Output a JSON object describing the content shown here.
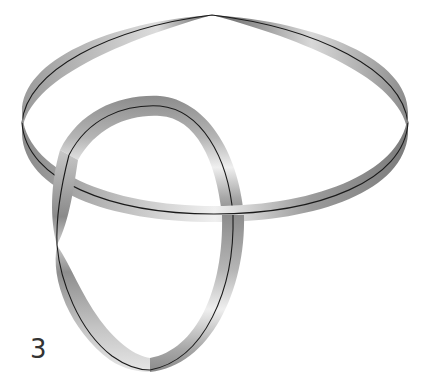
{
  "figure": {
    "label": "3",
    "colors": {
      "background": "#ffffff",
      "band_dark": "#7a7a7a",
      "band_light": "#f2f2f2",
      "centerline": "#1a1a1a",
      "label": "#333333"
    },
    "rings": [
      {
        "name": "horizontal-ring",
        "center": [
          214,
          112
        ],
        "rx": 192,
        "ry": 92,
        "band_width": 22,
        "twist_at": [
          212,
          15
        ]
      },
      {
        "name": "vertical-ring",
        "center": [
          146,
          232
        ],
        "rx": 96,
        "ry": 138,
        "band_width": 22,
        "twist_at": [
          57,
          245
        ]
      }
    ]
  }
}
